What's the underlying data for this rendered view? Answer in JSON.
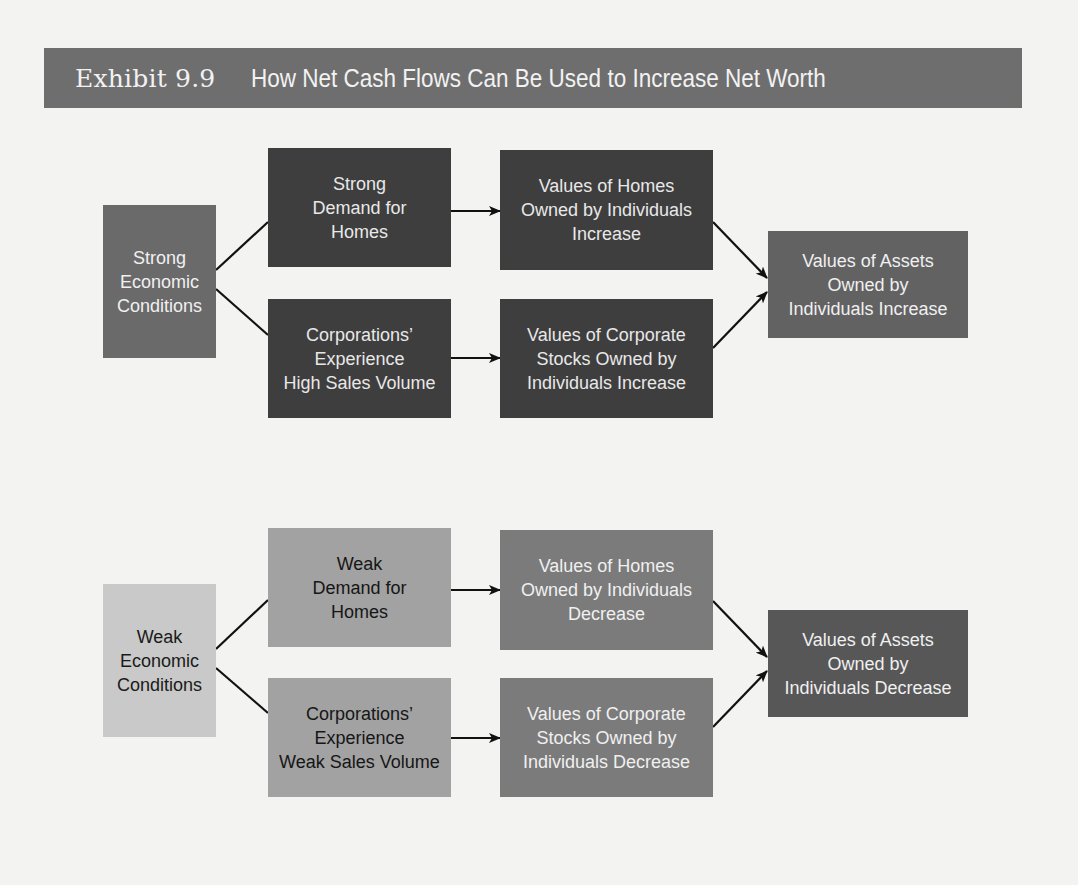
{
  "title": {
    "exhibit": "Exhibit 9.9",
    "text": "How Net Cash Flows Can Be Used to Increase Net Worth"
  },
  "colors": {
    "title_bar": "#6e6e6e",
    "strong_conditions": "#6a6a6a",
    "strong_dark": "#3e3e3e",
    "assets_increase": "#626262",
    "weak_conditions": "#c9c9c9",
    "weak_light": "#a2a2a2",
    "weak_medium": "#7b7b7b",
    "assets_decrease": "#575757"
  },
  "top_flow": {
    "condition": "Strong\nEconomic\nConditions",
    "branch1": "Strong\nDemand for\nHomes",
    "branch2": "Corporations’\nExperience\nHigh Sales Volume",
    "effect1": "Values of Homes\nOwned by Individuals\nIncrease",
    "effect2": "Values of Corporate\nStocks Owned by\nIndividuals Increase",
    "result": "Values of Assets\nOwned by\nIndividuals Increase"
  },
  "bottom_flow": {
    "condition": "Weak\nEconomic\nConditions",
    "branch1": "Weak\nDemand for\nHomes",
    "branch2": "Corporations’\nExperience\nWeak Sales Volume",
    "effect1": "Values of Homes\nOwned by Individuals\nDecrease",
    "effect2": "Values of Corporate\nStocks Owned by\nIndividuals Decrease",
    "result": "Values of Assets\nOwned by\nIndividuals Decrease"
  }
}
